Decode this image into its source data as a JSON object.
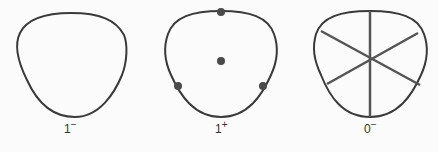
{
  "figures": [
    {
      "id": "shape-1",
      "label": "1",
      "superscript": "−",
      "markings": "none"
    },
    {
      "id": "shape-2",
      "label": "1",
      "superscript": "+",
      "markings": "dots",
      "dot_count": 4
    },
    {
      "id": "shape-3",
      "label": "0",
      "superscript": "−",
      "markings": "spokes",
      "spoke_count": 6
    }
  ],
  "colors": {
    "outline": "#3a3a3a",
    "marks": "#4a4a4a",
    "background": "#fbfbfb"
  }
}
